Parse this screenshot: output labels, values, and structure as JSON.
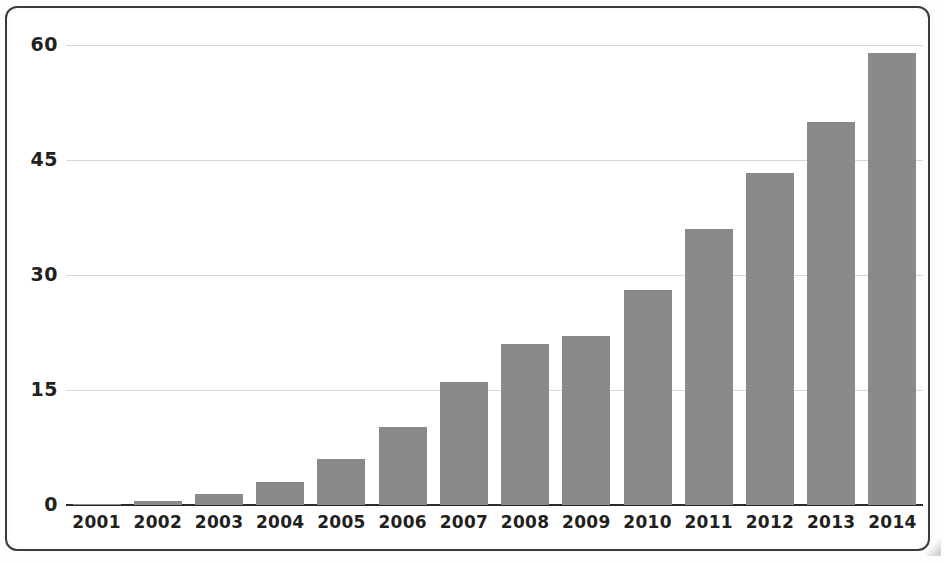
{
  "chart_data": {
    "type": "bar",
    "title": "",
    "subtitle": "",
    "xlabel": "",
    "ylabel": "",
    "categories": [
      "2001",
      "2002",
      "2003",
      "2004",
      "2005",
      "2006",
      "2007",
      "2008",
      "2009",
      "2010",
      "2011",
      "2012",
      "2013",
      "2014"
    ],
    "values": [
      0.1,
      0.5,
      1.5,
      3.0,
      6.0,
      10.2,
      16.0,
      21.0,
      22.0,
      28.0,
      36.0,
      43.3,
      50.0,
      59.0
    ],
    "series": [
      {
        "name": "",
        "values": [
          0.1,
          0.5,
          1.5,
          3.0,
          6.0,
          10.2,
          16.0,
          21.0,
          22.0,
          28.0,
          36.0,
          43.3,
          50.0,
          59.0
        ]
      }
    ],
    "ylim": [
      0,
      60
    ],
    "yticks": [
      0,
      15,
      30,
      45,
      60
    ],
    "ytick_labels": [
      "0",
      "15",
      "30",
      "45",
      "60"
    ],
    "xtick_labels": [
      "2001",
      "2002",
      "2003",
      "2004",
      "2005",
      "2006",
      "2007",
      "2008",
      "2009",
      "2010",
      "2011",
      "2012",
      "2013",
      "2014"
    ],
    "grid": true,
    "legend": null,
    "legend_position": "none",
    "annotations": [],
    "colors": {
      "bar_fill": "#8a8b88",
      "gridline": "#d8d8d6",
      "axis_line": "#2b2b2b",
      "tick_label": "#231f20",
      "frame_border": "#3b3b3b",
      "background": "#ffffff"
    }
  },
  "figure": {
    "frame": "rounded-rectangle-border"
  }
}
